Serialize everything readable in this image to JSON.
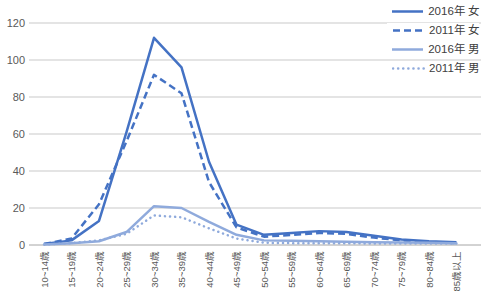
{
  "chart": {
    "background": "#ffffff",
    "grid_color": "#c9c9c9",
    "axis_color": "#a6a6a6",
    "tick_label_color": "#595959",
    "legend_text_color": "#404040"
  },
  "chart_data": {
    "type": "line",
    "title": "",
    "xlabel": "",
    "ylabel": "",
    "ylim": [
      0,
      120
    ],
    "yticks": [
      0,
      20,
      40,
      60,
      80,
      100,
      120
    ],
    "grid": true,
    "legend_position": "top-right",
    "categories": [
      "10~14歳",
      "15~19歳",
      "20~24歳",
      "25~29歳",
      "30~34歳",
      "35~39歳",
      "40~44歳",
      "45~49歳",
      "50~54歳",
      "55~59歳",
      "60~64歳",
      "65~69歳",
      "70~74歳",
      "75~79歳",
      "80~84歳",
      "85歳以上"
    ],
    "series": [
      {
        "name": "2016年 女",
        "color": "#4472c4",
        "style": "solid",
        "values": [
          0.5,
          2.5,
          13,
          61,
          112,
          96,
          45,
          11,
          5.5,
          6.5,
          7.5,
          7,
          5,
          3,
          2,
          1.5
        ]
      },
      {
        "name": "2011年 女",
        "color": "#4472c4",
        "style": "dashed",
        "values": [
          0.5,
          3.5,
          22,
          56,
          92,
          82,
          34,
          9.5,
          4.5,
          5.5,
          6.5,
          6,
          4,
          2.5,
          1.5,
          1
        ]
      },
      {
        "name": "2016年 男",
        "color": "#8faadc",
        "style": "solid",
        "values": [
          0.3,
          1,
          2,
          7,
          21,
          20,
          12.5,
          5.5,
          2.5,
          2.3,
          2,
          1.8,
          1.5,
          1.3,
          1.2,
          1
        ]
      },
      {
        "name": "2011年 男",
        "color": "#8faadc",
        "style": "dotted",
        "values": [
          0.3,
          1,
          2.5,
          6,
          16,
          15,
          9,
          3.5,
          1.2,
          1,
          1,
          1,
          0.8,
          0.8,
          0.8,
          0.8
        ]
      }
    ]
  }
}
